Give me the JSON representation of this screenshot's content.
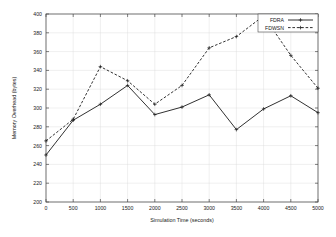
{
  "chart_data": {
    "type": "line",
    "title": "",
    "xlabel": "Simulation Time (seconds)",
    "ylabel": "Memory Overhead (bytes)",
    "xlim": [
      0,
      5000
    ],
    "ylim": [
      200,
      400
    ],
    "grid": true,
    "legend_position": "top-right",
    "x": [
      0,
      500,
      1000,
      1500,
      2000,
      2500,
      3000,
      3500,
      4000,
      4500,
      5000
    ],
    "xticks": [
      "0",
      "500",
      "1000",
      "1500",
      "2000",
      "2500",
      "3000",
      "3500",
      "4000",
      "4500",
      "5000"
    ],
    "yticks": [
      "200",
      "220",
      "240",
      "260",
      "280",
      "300",
      "320",
      "340",
      "360",
      "380",
      "400"
    ],
    "series": [
      {
        "name": "FDRA",
        "style": "solid",
        "marker": "plus",
        "color": "#1a1a1a",
        "values": [
          250,
          287,
          304,
          324,
          293,
          301,
          314,
          277,
          299,
          313,
          295
        ]
      },
      {
        "name": "FDWSN",
        "style": "dashed",
        "marker": "plus",
        "color": "#1a1a1a",
        "values": [
          265,
          288,
          344,
          329,
          304,
          324,
          364,
          376,
          398,
          356,
          321
        ]
      }
    ]
  },
  "legend": {
    "entries": [
      {
        "label": "FDRA"
      },
      {
        "label": "FDWSN"
      }
    ]
  }
}
